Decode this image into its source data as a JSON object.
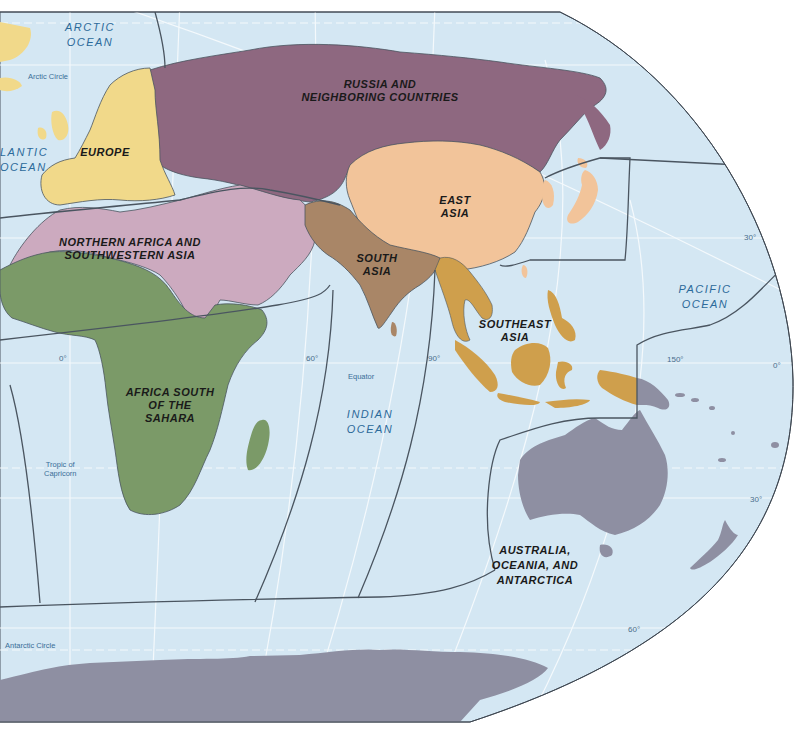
{
  "map": {
    "colors": {
      "ocean": "#d4e7f3",
      "background": "#ffffff",
      "graticule": "#f2f8fc",
      "region_border": "#4a5560",
      "russia": "#8e6880",
      "europe": "#f1d98a",
      "north_africa_sw_asia": "#ccaabf",
      "africa_south": "#7b9a68",
      "east_asia": "#f2c49a",
      "south_asia": "#a98667",
      "southeast_asia": "#cf9f4c",
      "australia_oceania_antarctica": "#8e8fa2"
    },
    "regions": [
      {
        "id": "russia",
        "label_lines": [
          "RUSSIA AND",
          "NEIGHBORING COUNTRIES"
        ]
      },
      {
        "id": "europe",
        "label_lines": [
          "EUROPE"
        ]
      },
      {
        "id": "north_africa_sw_asia",
        "label_lines": [
          "NORTHERN AFRICA AND",
          "SOUTHWESTERN ASIA"
        ]
      },
      {
        "id": "east_asia",
        "label_lines": [
          "EAST",
          "ASIA"
        ]
      },
      {
        "id": "south_asia",
        "label_lines": [
          "SOUTH",
          "ASIA"
        ]
      },
      {
        "id": "southeast_asia",
        "label_lines": [
          "SOUTHEAST",
          "ASIA"
        ]
      },
      {
        "id": "africa_south",
        "label_lines": [
          "AFRICA SOUTH",
          "OF THE",
          "SAHARA"
        ]
      },
      {
        "id": "australia_oceania_antarctica",
        "label_lines": [
          "AUSTRALIA,",
          "OCEANIA, AND",
          "ANTARCTICA"
        ]
      }
    ],
    "oceans": [
      {
        "id": "arctic",
        "label_lines": [
          "ARCTIC",
          "OCEAN"
        ]
      },
      {
        "id": "atlantic",
        "label_lines": [
          "LANTIC",
          "OCEAN"
        ]
      },
      {
        "id": "indian",
        "label_lines": [
          "INDIAN",
          "OCEAN"
        ]
      },
      {
        "id": "pacific",
        "label_lines": [
          "PACIFIC",
          "OCEAN"
        ]
      }
    ],
    "reference_lines": {
      "arctic_circle": "Arctic Circle",
      "equator": "Equator",
      "tropic_of_capricorn_lines": [
        "Tropic of",
        "Capricorn"
      ],
      "antarctic_circle": "Antarctic Circle"
    },
    "degree_labels": {
      "lon_0": "0°",
      "lon_60": "60°",
      "lon_90": "90°",
      "lon_150": "150°",
      "lat_0_right": "0°",
      "lat_30_north": "30°",
      "lat_30_south": "30°",
      "lat_60_south": "60°"
    }
  }
}
